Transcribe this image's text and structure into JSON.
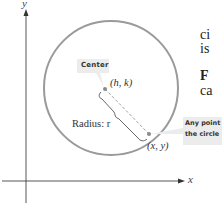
{
  "diagram": {
    "axes": {
      "x_label": "x",
      "y_label": "y"
    },
    "center_callout": "Center",
    "center_point_label": "(h, k)",
    "radius_label": "Radius: r",
    "point_label": "(x, y)",
    "point_callout_line1": "Any point on",
    "point_callout_line2": "the circle",
    "colors": {
      "circle": "#9a9a9a",
      "callout_bg": "#ececec",
      "point": "#8a8a8a",
      "axis": "#333333"
    }
  },
  "side_text": {
    "line1": "ci",
    "line2": "is",
    "line3": "F",
    "line4": "ca"
  }
}
